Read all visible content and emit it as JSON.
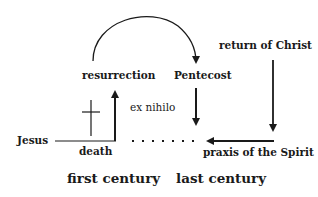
{
  "labels": {
    "resurrection": "resurrection",
    "pentecost": "Pentecost",
    "return_of_christ": "return of Christ",
    "ex_nihilo": "ex nihilo",
    "jesus": "Jesus",
    "death": "death",
    "praxis": "praxis of the Spirit",
    "first_century": "first century",
    "last_century": "last century"
  },
  "colors": {
    "ink": "#1a1a1a",
    "background": "#ffffff"
  }
}
